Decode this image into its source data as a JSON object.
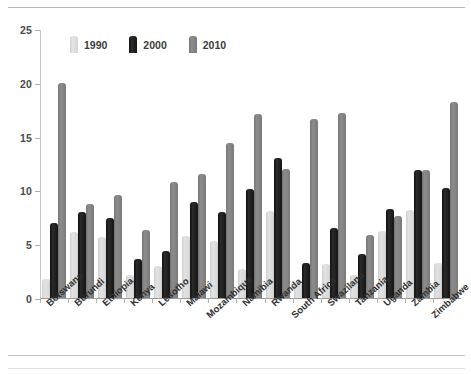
{
  "chart_data": {
    "type": "bar",
    "title": "",
    "subtitle": "",
    "xlabel": "",
    "ylabel": "",
    "ylim": [
      0,
      25
    ],
    "yticks": [
      0,
      5,
      10,
      15,
      20,
      25
    ],
    "grid": false,
    "legend_position": "top-left-inside",
    "categories": [
      "Botswana",
      "Burundi",
      "Ethiopia",
      "Kenya",
      "Lesotho",
      "Malawi",
      "Mozambique",
      "Namibia",
      "Rwanda",
      "South Africa",
      "Swaziland",
      "Tanzania",
      "Uganda",
      "Zambia",
      "Zimbabwe"
    ],
    "series": [
      {
        "name": "1990",
        "color": "#d9d9d9",
        "values": [
          1.8,
          6.1,
          5.7,
          2.1,
          3.0,
          5.8,
          5.3,
          2.7,
          8.1,
          1.5,
          3.2,
          2.1,
          6.2,
          8.2,
          3.3
        ]
      },
      {
        "name": "2000",
        "color": "#1a1a1a",
        "values": [
          7.0,
          8.0,
          7.4,
          3.6,
          4.4,
          8.9,
          8.0,
          10.1,
          13.0,
          3.3,
          6.5,
          4.1,
          8.3,
          11.9,
          10.2
        ]
      },
      {
        "name": "2010",
        "color": "#808080",
        "values": [
          20.0,
          8.7,
          9.6,
          6.3,
          10.8,
          11.5,
          14.4,
          17.1,
          12.0,
          16.6,
          17.2,
          5.9,
          7.6,
          11.9,
          18.2
        ]
      }
    ]
  },
  "legend": {
    "items": [
      {
        "label": "1990",
        "key": "y1990"
      },
      {
        "label": "2000",
        "key": "y2000"
      },
      {
        "label": "2010",
        "key": "y2010"
      }
    ]
  },
  "axis": {
    "y_tick_labels": [
      "25",
      "20",
      "15",
      "10",
      "5",
      "0"
    ]
  }
}
